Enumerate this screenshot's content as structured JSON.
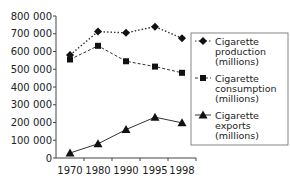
{
  "chart_data": {
    "type": "line",
    "title": "",
    "xlabel": "",
    "ylabel": "",
    "categories": [
      "1970",
      "1980",
      "1990",
      "1995",
      "1998"
    ],
    "y_ticks": [
      "0",
      "100 000",
      "200 000",
      "300 000",
      "400 000",
      "500 000",
      "600 000",
      "700 000",
      "800 000"
    ],
    "ylim": [
      0,
      800000
    ],
    "grid": false,
    "legend_position": "right",
    "series": [
      {
        "name": "Cigarette production (millions)",
        "legend_lines": [
          "Cigarette",
          "production",
          "(millions)"
        ],
        "marker": "diamond",
        "line_style": "dotted",
        "values": [
          580000,
          712000,
          705000,
          740000,
          675000
        ]
      },
      {
        "name": "Cigarette consumption (millions)",
        "legend_lines": [
          "Cigarette",
          "consumption",
          "(millions)"
        ],
        "marker": "square",
        "line_style": "dashed",
        "values": [
          555000,
          632000,
          545000,
          515000,
          480000
        ]
      },
      {
        "name": "Cigarette exports (millions)",
        "legend_lines": [
          "Cigarette",
          "exports",
          "(millions)"
        ],
        "marker": "triangle",
        "line_style": "solid",
        "values": [
          28000,
          80000,
          160000,
          230000,
          198000
        ]
      }
    ]
  }
}
